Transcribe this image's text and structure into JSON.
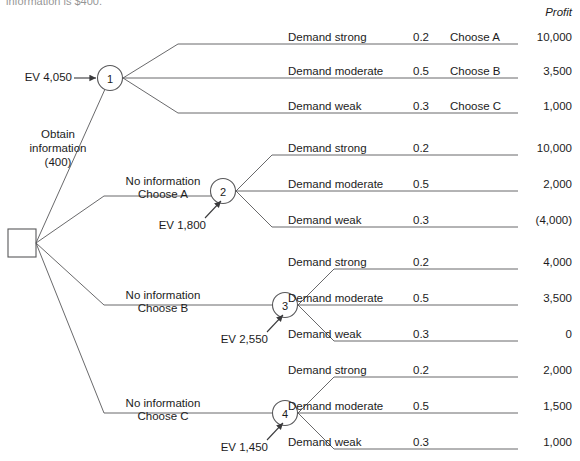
{
  "page": {
    "cut_off_caption": "information is $400.",
    "profit_header": "Profit"
  },
  "root": {
    "name": "decision-square",
    "branch_labels": [
      {
        "line1": "Obtain",
        "line2": "information",
        "line3": "(400)"
      },
      {
        "line1": "No information",
        "line2": "Choose A"
      },
      {
        "line1": "No information",
        "line2": "Choose B"
      },
      {
        "line1": "No information",
        "line2": "Choose C"
      }
    ]
  },
  "nodes": [
    {
      "id": "1",
      "number": "1",
      "ev_label": "EV 4,050"
    },
    {
      "id": "2",
      "number": "2",
      "ev_label": "EV 1,800"
    },
    {
      "id": "3",
      "number": "3",
      "ev_label": "EV 2,550"
    },
    {
      "id": "4",
      "number": "4",
      "ev_label": "EV 1,450"
    }
  ],
  "branches": {
    "node1": [
      {
        "demand": "Demand strong",
        "probability": "0.2",
        "choice": "Choose A",
        "profit": "10,000"
      },
      {
        "demand": "Demand moderate",
        "probability": "0.5",
        "choice": "Choose B",
        "profit": "3,500"
      },
      {
        "demand": "Demand weak",
        "probability": "0.3",
        "choice": "Choose C",
        "profit": "1,000"
      }
    ],
    "node2": [
      {
        "demand": "Demand strong",
        "probability": "0.2",
        "choice": "",
        "profit": "10,000"
      },
      {
        "demand": "Demand moderate",
        "probability": "0.5",
        "choice": "",
        "profit": "2,000"
      },
      {
        "demand": "Demand weak",
        "probability": "0.3",
        "choice": "",
        "profit": "(4,000)"
      }
    ],
    "node3": [
      {
        "demand": "Demand strong",
        "probability": "0.2",
        "choice": "",
        "profit": "4,000"
      },
      {
        "demand": "Demand moderate",
        "probability": "0.5",
        "choice": "",
        "profit": "3,500"
      },
      {
        "demand": "Demand weak",
        "probability": "0.3",
        "choice": "",
        "profit": "0"
      }
    ],
    "node4": [
      {
        "demand": "Demand strong",
        "probability": "0.2",
        "choice": "",
        "profit": "2,000"
      },
      {
        "demand": "Demand moderate",
        "probability": "0.5",
        "choice": "",
        "profit": "1,500"
      },
      {
        "demand": "Demand weak",
        "probability": "0.3",
        "choice": "",
        "profit": "1,000"
      }
    ]
  },
  "colors": {
    "line": "#58585a",
    "text": "#1c1c1c"
  }
}
